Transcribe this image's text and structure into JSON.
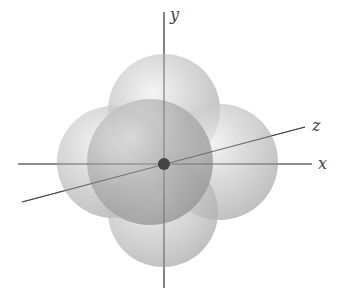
{
  "diagram": {
    "type": "3d-orbital-spheres",
    "axes": {
      "x_label": "x",
      "y_label": "y",
      "z_label": "z"
    },
    "colors": {
      "axis": "#555555",
      "sphere": "#b8b8b8",
      "nucleus": "#444444",
      "background": "#ffffff"
    },
    "spheres": [
      {
        "name": "top",
        "cx": 164,
        "cy": 110,
        "r": 56
      },
      {
        "name": "left",
        "cx": 113,
        "cy": 162,
        "r": 56
      },
      {
        "name": "right",
        "cx": 220,
        "cy": 162,
        "r": 58
      },
      {
        "name": "bottom",
        "cx": 163,
        "cy": 212,
        "r": 55
      },
      {
        "name": "front",
        "cx": 150,
        "cy": 162,
        "r": 63
      }
    ]
  }
}
